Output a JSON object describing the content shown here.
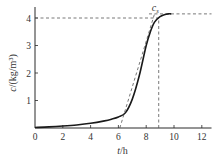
{
  "chart_data": {
    "type": "line",
    "title": "",
    "xlabel": "t/h",
    "ylabel": "c/(kg/m³)",
    "xlim": [
      0,
      12.7
    ],
    "ylim": [
      0,
      4.4
    ],
    "xticks": [
      0,
      2,
      4,
      6,
      8,
      10,
      12
    ],
    "yticks": [
      1,
      2,
      3,
      4
    ],
    "grid": false,
    "series": [
      {
        "name": "concentration curve",
        "style": "solid",
        "x": [
          0,
          1,
          2,
          3,
          4,
          5,
          5.5,
          6,
          6.5,
          7,
          7.5,
          8,
          8.3,
          8.6,
          9,
          9.3,
          9.6,
          9.8
        ],
        "y": [
          0.02,
          0.04,
          0.07,
          0.11,
          0.17,
          0.26,
          0.32,
          0.4,
          0.55,
          1.05,
          1.9,
          3.0,
          3.5,
          3.85,
          4.05,
          4.12,
          4.15,
          4.15
        ]
      },
      {
        "name": "tangent line",
        "style": "dashed",
        "x": [
          6.1,
          8.6
        ],
        "y": [
          0,
          4.15
        ]
      }
    ],
    "reference_lines": [
      {
        "orientation": "horizontal",
        "y": 4.0,
        "x_from": 0,
        "x_to": 8.9,
        "style": "dashed"
      },
      {
        "orientation": "horizontal",
        "y": 4.15,
        "x_from": 8.2,
        "x_to": 12.7,
        "style": "dashed"
      },
      {
        "orientation": "vertical",
        "x": 8.9,
        "y_from": 0,
        "y_to": 4.0,
        "style": "dashed"
      }
    ],
    "annotations": [
      {
        "text": "cs",
        "x": 8.4,
        "y": 4.3
      }
    ]
  },
  "labels": {
    "xlabel_italic": "t",
    "xlabel_rest": "/h",
    "ylabel_italic": "c",
    "ylabel_rest": "/(kg/m³)",
    "annotation_main": "c",
    "annotation_sub": "s"
  }
}
